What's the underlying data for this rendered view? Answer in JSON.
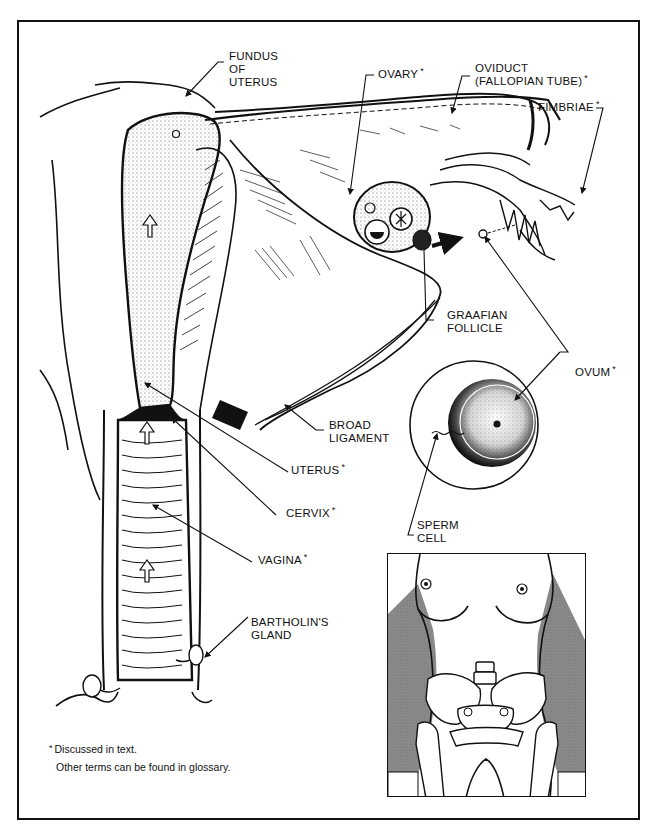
{
  "figure": {
    "type": "anatomical-illustration",
    "style": "black and white line drawing",
    "colors": {
      "ink": "#111111",
      "paper": "#ffffff",
      "shading": "#8a8a8a"
    }
  },
  "labels": {
    "fundus": {
      "line1": "FUNDUS",
      "line2": "OF",
      "line3": "UTERUS",
      "asterisk": ""
    },
    "ovary": {
      "text": "OVARY",
      "asterisk": "*"
    },
    "oviduct": {
      "line1": "OVIDUCT",
      "line2": "(FALLOPIAN TUBE)",
      "asterisk": "*"
    },
    "fimbriae": {
      "text": "FIMBRIAE",
      "asterisk": "*"
    },
    "graafian": {
      "line1": "GRAAFIAN",
      "line2": "FOLLICLE",
      "asterisk": ""
    },
    "ovum": {
      "text": "OVUM",
      "asterisk": "*"
    },
    "broad_ligament": {
      "line1": "BROAD",
      "line2": "LIGAMENT",
      "asterisk": ""
    },
    "uterus": {
      "text": "UTERUS",
      "asterisk": "*"
    },
    "cervix": {
      "text": "CERVIX",
      "asterisk": "*"
    },
    "sperm_cell": {
      "line1": "SPERM",
      "line2": "CELL",
      "asterisk": ""
    },
    "vagina": {
      "text": "VAGINA",
      "asterisk": "*"
    },
    "bartholin": {
      "line1": "BARTHOLIN'S",
      "line2": "GLAND",
      "asterisk": ""
    }
  },
  "footnote": {
    "asterisk": "*",
    "line1": "Discussed in text.",
    "line2": "Other terms can be found in glossary."
  },
  "inset": {
    "description": "Front view of female torso with pelvic bones showing location of organs"
  }
}
